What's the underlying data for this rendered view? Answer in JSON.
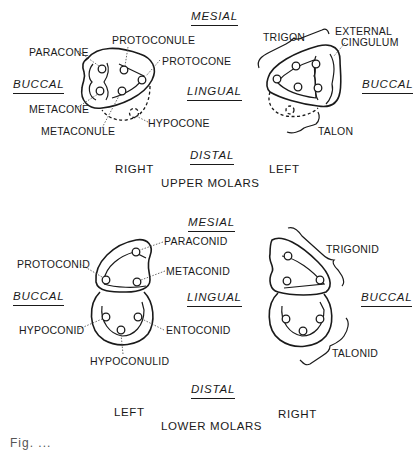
{
  "upper": {
    "title": "UPPER MOLARS",
    "directions": {
      "mesial": "MESIAL",
      "distal": "DISTAL",
      "buccal_left": "BUCCAL",
      "lingual": "LINGUAL",
      "buccal_right": "BUCCAL"
    },
    "sides": {
      "left_tooth": "RIGHT",
      "right_tooth": "LEFT"
    },
    "cusps": {
      "paracone": "PARACONE",
      "protoconule": "PROTOCONULE",
      "protocone": "PROTOCONE",
      "metacone": "METACONE",
      "metaconule": "METACONULE",
      "hypocone": "HYPOCONE"
    },
    "regions": {
      "trigon": "TRIGON",
      "external_cingulum_1": "EXTERNAL",
      "external_cingulum_2": "CINGULUM",
      "talon": "TALON"
    }
  },
  "lower": {
    "title": "LOWER MOLARS",
    "directions": {
      "mesial": "MESIAL",
      "distal": "DISTAL",
      "buccal_left": "BUCCAL",
      "lingual": "LINGUAL",
      "buccal_right": "BUCCAL"
    },
    "sides": {
      "left_tooth": "LEFT",
      "right_tooth": "RIGHT"
    },
    "cusps": {
      "paraconid": "PARACONID",
      "protoconid": "PROTOCONID",
      "metaconid": "METACONID",
      "hypoconid": "HYPOCONID",
      "entoconid": "ENTOCONID",
      "hypoconulid": "HYPOCONULID"
    },
    "regions": {
      "trigonid": "TRIGONID",
      "talonid": "TALONID"
    }
  },
  "caption": "Fig. ..."
}
